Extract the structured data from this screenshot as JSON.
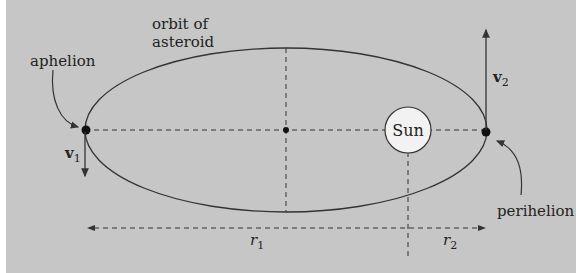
{
  "diagram": {
    "title_line1": "orbit of",
    "title_line2": "asteroid",
    "labels": {
      "aphelion": "aphelion",
      "perihelion": "perihelion",
      "sun": "Sun",
      "v1_main": "v",
      "v1_sub": "1",
      "v2_main": "v",
      "v2_sub": "2",
      "r1_main": "r",
      "r1_sub": "1",
      "r2_main": "r",
      "r2_sub": "2"
    },
    "colors": {
      "background": "#c6c6c6",
      "sun_fill": "#f2f2f2",
      "line": "#333333"
    }
  }
}
